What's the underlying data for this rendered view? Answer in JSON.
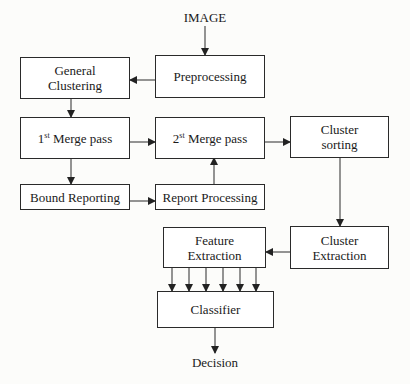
{
  "diagram": {
    "input_label": "IMAGE",
    "output_label": "Decision",
    "nodes": {
      "preprocessing": {
        "text": "Preprocessing"
      },
      "general_clustering": {
        "line1": "General",
        "line2": "Clustering"
      },
      "merge1": {
        "prefix": "1",
        "sup": "st",
        "suffix": " Merge pass"
      },
      "merge2": {
        "prefix": "2",
        "sup": "st",
        "suffix": " Merge pass"
      },
      "cluster_sorting": {
        "line1": "Cluster",
        "line2": "sorting"
      },
      "bound_reporting": {
        "text": "Bound Reporting"
      },
      "report_processing": {
        "text": "Report Processing"
      },
      "cluster_extraction": {
        "line1": "Cluster",
        "line2": "Extraction"
      },
      "feature_extraction": {
        "line1": "Feature",
        "line2": "Extraction"
      },
      "classifier": {
        "text": "Classifier"
      }
    },
    "edges": [
      [
        "IMAGE",
        "Preprocessing"
      ],
      [
        "Preprocessing",
        "General Clustering"
      ],
      [
        "General Clustering",
        "1st Merge pass"
      ],
      [
        "1st Merge pass",
        "2nd Merge pass"
      ],
      [
        "1st Merge pass",
        "Bound Reporting"
      ],
      [
        "Bound Reporting",
        "Report Processing"
      ],
      [
        "Report Processing",
        "2nd Merge pass"
      ],
      [
        "2nd Merge pass",
        "Cluster sorting"
      ],
      [
        "Cluster sorting",
        "Cluster Extraction"
      ],
      [
        "Cluster Extraction",
        "Feature Extraction"
      ],
      [
        "Feature Extraction",
        "Classifier (x6)"
      ],
      [
        "Classifier",
        "Decision"
      ]
    ],
    "line_color": "#2a2a2a"
  }
}
